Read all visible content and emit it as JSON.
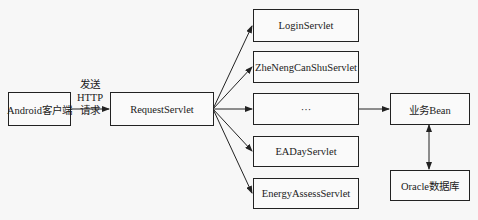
{
  "diagram": {
    "nodes": {
      "client": "Android客户端",
      "request_servlet": "RequestServlet",
      "servlets": [
        "LoginServlet",
        "ZheNengCanShuServlet",
        "···",
        "EADayServlet",
        "EnergyAssessServlet"
      ],
      "bean": "业务Bean",
      "db": "Oracle数据库"
    },
    "edges": {
      "client_to_request": "发送HTTP请求",
      "client_to_request_line1": "发送HTTP",
      "client_to_request_line2": "请求"
    }
  }
}
